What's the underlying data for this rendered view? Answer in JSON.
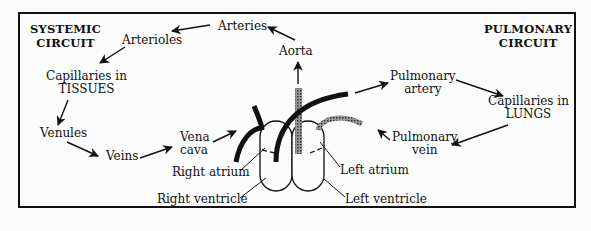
{
  "diagram": {
    "systemic_title": [
      "SYSTEMIC",
      "CIRCUIT"
    ],
    "pulmonary_title": [
      "PULMONARY",
      "CIRCUIT"
    ],
    "labels": {
      "arteries": "Arteries",
      "arterioles": "Arterioles",
      "aorta": "Aorta",
      "capillaries_tissues": [
        "Capillaries in",
        "TISSUES"
      ],
      "venules": "Venules",
      "veins": "Veins",
      "vena_cava": [
        "Vena",
        "cava"
      ],
      "right_atrium": "Right atrium",
      "right_ventricle": "Right ventricle",
      "left_atrium": "Left atrium",
      "left_ventricle": "Left ventricle",
      "pulmonary_artery": [
        "Pulmonary",
        "artery"
      ],
      "capillaries_lungs": [
        "Capillaries in",
        "LUNGS"
      ],
      "pulmonary_vein": [
        "Pulmonary",
        "vein"
      ]
    },
    "flow": [
      "Vena cava",
      "Right atrium",
      "Right ventricle",
      "Pulmonary artery",
      "Capillaries in LUNGS",
      "Pulmonary vein",
      "Left atrium",
      "Left ventricle",
      "Aorta",
      "Arteries",
      "Arterioles",
      "Capillaries in TISSUES",
      "Venules",
      "Veins",
      "Vena cava"
    ]
  }
}
